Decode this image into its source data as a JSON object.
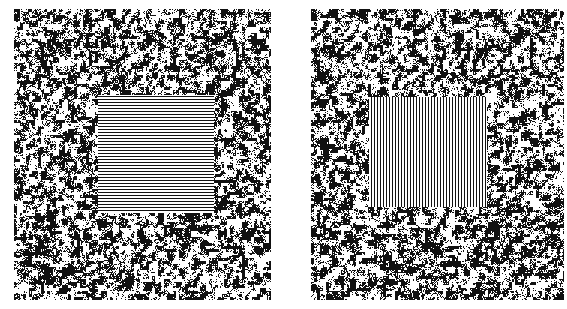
{
  "figure": {
    "panels": [
      {
        "id": "left",
        "background": "random black-and-white blob noise",
        "center_region": "horizontal stripe texture",
        "center_orientation": "horizontal",
        "center_box": {
          "x": 84,
          "y": 86,
          "w": 116,
          "h": 118
        }
      },
      {
        "id": "right",
        "background": "random black-and-white blob noise",
        "center_region": "vertical stripe texture",
        "center_orientation": "vertical",
        "center_box": {
          "x": 58,
          "y": 88,
          "w": 118,
          "h": 110
        }
      }
    ],
    "colors": {
      "ink": "#111111",
      "paper": "#ffffff"
    }
  }
}
